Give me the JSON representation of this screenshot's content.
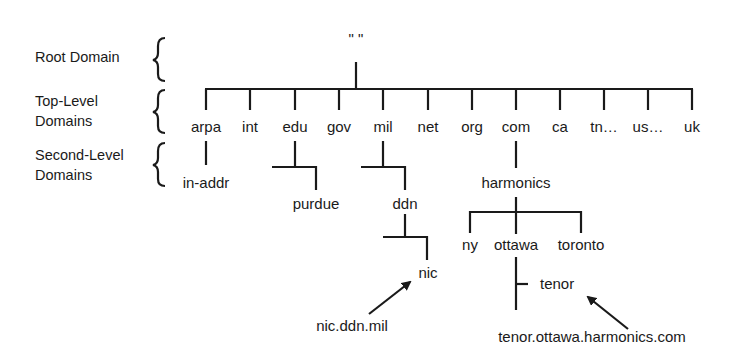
{
  "levels": {
    "root": "Root Domain",
    "tld_line1": "Top-Level",
    "tld_line2": "Domains",
    "sld_line1": "Second-Level",
    "sld_line2": "Domains"
  },
  "root_label": "\"   \"",
  "tlds": [
    "arpa",
    "int",
    "edu",
    "gov",
    "mil",
    "net",
    "org",
    "com",
    "ca",
    "tn…",
    "us…",
    "uk"
  ],
  "second_level": {
    "arpa": "in-addr",
    "edu": "purdue",
    "mil": "ddn",
    "com": "harmonics"
  },
  "third_level": {
    "ddn": "nic",
    "harmonics": [
      "ny",
      "ottawa",
      "toronto"
    ]
  },
  "fourth_level": {
    "ottawa": "tenor"
  },
  "fqdn_examples": {
    "nic": "nic.ddn.mil",
    "tenor": "tenor.ottawa.harmonics.com"
  }
}
